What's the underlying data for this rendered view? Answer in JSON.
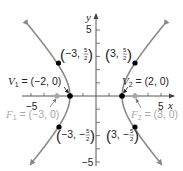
{
  "diagram": {
    "type": "hyperbola",
    "equation": "x^2/4 - y^2/5 = 1",
    "axes": {
      "x_label": "x",
      "y_label": "y",
      "x_tick_labels": [
        {
          "value": -5,
          "text": "−5"
        },
        {
          "value": 5,
          "text": "5"
        }
      ],
      "y_tick_labels": [
        {
          "value": 5,
          "text": "5"
        },
        {
          "value": -5,
          "text": "−5"
        }
      ],
      "x_range": [
        -5.7,
        5.9
      ],
      "y_range": [
        -5.5,
        5.5
      ]
    },
    "vertices": [
      {
        "name": "V",
        "sub": "1",
        "rest": " = (−2, 0)",
        "x": -2,
        "y": 0
      },
      {
        "name": "V",
        "sub": "2",
        "rest": " = (2, 0)",
        "x": 2,
        "y": 0
      }
    ],
    "foci": [
      {
        "name": "F",
        "sub": "1",
        "rest": " = (−3, 0)",
        "x": -3,
        "y": 0
      },
      {
        "name": "F",
        "sub": "2",
        "rest": " = (3, 0)",
        "x": 3,
        "y": 0
      }
    ],
    "points": [
      {
        "label_pre": "−3, ",
        "num": "5",
        "den": "2",
        "x": -3,
        "y": 2.5
      },
      {
        "label_pre": "3, ",
        "num": "5",
        "den": "2",
        "x": 3,
        "y": 2.5
      },
      {
        "label_pre": "−3, −",
        "num": "5",
        "den": "2",
        "x": -3,
        "y": -2.5
      },
      {
        "label_pre": "3, −",
        "num": "5",
        "den": "2",
        "x": 3,
        "y": -2.5
      }
    ],
    "colors": {
      "curve": "#8a8a8a",
      "axis": "#555555",
      "point": "#000000",
      "focus": "#a8a8a8",
      "text": "#222222"
    }
  }
}
